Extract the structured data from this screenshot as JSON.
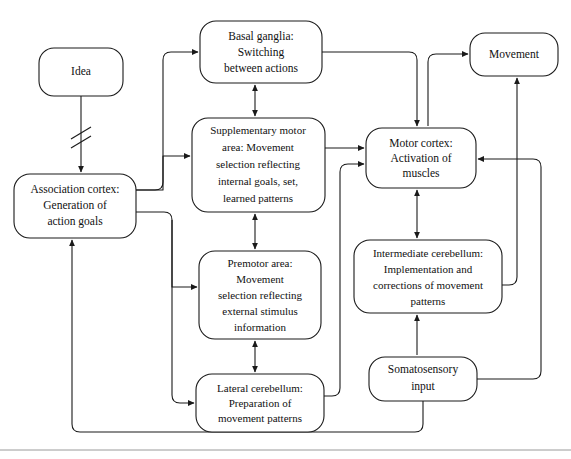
{
  "diagram": {
    "background_color": "#ffffff",
    "line_color": "#1a1a1a",
    "nodes": [
      {
        "id": "idea",
        "name": "idea",
        "lines": [
          "Idea"
        ],
        "x": 39,
        "y": 48,
        "w": 84,
        "h": 48
      },
      {
        "id": "association-cortex",
        "name": "association-cortex",
        "lines": [
          "Association cortex:",
          "Generation of",
          "action goals"
        ],
        "x": 14,
        "y": 174,
        "w": 122,
        "h": 64
      },
      {
        "id": "basal-ganglia",
        "name": "basal-ganglia",
        "lines": [
          "Basal ganglia:",
          "Switching",
          "between actions"
        ],
        "x": 200,
        "y": 21,
        "w": 122,
        "h": 62
      },
      {
        "id": "supplementary-motor-area",
        "name": "supplementary-motor-area",
        "lines": [
          "Supplementary motor",
          "area:  Movement",
          "selection reflecting",
          "internal goals, set,",
          "learned patterns"
        ],
        "x": 192,
        "y": 118,
        "w": 133,
        "h": 94
      },
      {
        "id": "premotor-area",
        "name": "premotor-area",
        "lines": [
          "Premotor area:",
          "Movement",
          "selection reflecting",
          "external stimulus",
          "information"
        ],
        "x": 199,
        "y": 251,
        "w": 122,
        "h": 88
      },
      {
        "id": "lateral-cerebellum",
        "name": "lateral-cerebellum",
        "lines": [
          "Lateral cerebellum:",
          "Preparation of",
          "movement patterns"
        ],
        "x": 196,
        "y": 374,
        "w": 128,
        "h": 58
      },
      {
        "id": "motor-cortex",
        "name": "motor-cortex",
        "lines": [
          "Motor cortex:",
          "Activation of",
          "muscles"
        ],
        "x": 366,
        "y": 128,
        "w": 110,
        "h": 60
      },
      {
        "id": "intermediate-cerebellum",
        "name": "intermediate-cerebellum",
        "lines": [
          "Intermediate cerebellum:",
          "Implementation and",
          "corrections of movement",
          "patterns"
        ],
        "x": 354,
        "y": 240,
        "w": 148,
        "h": 73
      },
      {
        "id": "somatosensory-input",
        "name": "somatosensory-input",
        "lines": [
          "Somatosensory",
          "input"
        ],
        "x": 369,
        "y": 357,
        "w": 108,
        "h": 44
      },
      {
        "id": "movement",
        "name": "movement",
        "lines": [
          "Movement"
        ],
        "x": 470,
        "y": 33,
        "w": 88,
        "h": 43
      }
    ],
    "edges": [
      {
        "id": "idea-to-association",
        "name": "edge-idea-to-association-cortex",
        "from": "idea",
        "to": "association-cortex",
        "style": "interrupted"
      },
      {
        "id": "association-to-basal",
        "name": "edge-association-cortex-to-basal-ganglia",
        "from": "association-cortex",
        "to": "basal-ganglia",
        "style": "plain"
      },
      {
        "id": "association-to-sma",
        "name": "edge-association-cortex-to-supplementary-motor-area",
        "from": "association-cortex",
        "to": "supplementary-motor-area",
        "style": "plain"
      },
      {
        "id": "association-to-premotor",
        "name": "edge-association-cortex-to-premotor-area",
        "from": "association-cortex",
        "to": "premotor-area",
        "style": "plain"
      },
      {
        "id": "association-to-lateral",
        "name": "edge-association-cortex-to-lateral-cerebellum",
        "from": "association-cortex",
        "to": "lateral-cerebellum",
        "style": "plain"
      },
      {
        "id": "basal-sma",
        "name": "edge-basal-ganglia-supplementary-motor-area",
        "from": "basal-ganglia",
        "to": "supplementary-motor-area",
        "style": "bidirectional"
      },
      {
        "id": "sma-premotor",
        "name": "edge-supplementary-motor-area-premotor-area",
        "from": "supplementary-motor-area",
        "to": "premotor-area",
        "style": "bidirectional"
      },
      {
        "id": "premotor-lateral",
        "name": "edge-premotor-area-lateral-cerebellum",
        "from": "premotor-area",
        "to": "lateral-cerebellum",
        "style": "bidirectional"
      },
      {
        "id": "basal-to-motor",
        "name": "edge-basal-ganglia-to-motor-cortex",
        "from": "basal-ganglia",
        "to": "motor-cortex",
        "style": "plain"
      },
      {
        "id": "sma-to-motor",
        "name": "edge-supplementary-motor-area-to-motor-cortex",
        "from": "supplementary-motor-area",
        "to": "motor-cortex",
        "style": "plain"
      },
      {
        "id": "lateral-to-motor",
        "name": "edge-lateral-cerebellum-to-motor-cortex",
        "from": "lateral-cerebellum",
        "to": "motor-cortex",
        "style": "plain"
      },
      {
        "id": "motor-intermediate",
        "name": "edge-motor-cortex-intermediate-cerebellum",
        "from": "motor-cortex",
        "to": "intermediate-cerebellum",
        "style": "bidirectional"
      },
      {
        "id": "motor-to-movement",
        "name": "edge-motor-cortex-to-movement",
        "from": "motor-cortex",
        "to": "movement",
        "style": "plain"
      },
      {
        "id": "intermediate-to-movement",
        "name": "edge-intermediate-cerebellum-to-movement",
        "from": "intermediate-cerebellum",
        "to": "movement",
        "style": "plain"
      },
      {
        "id": "somato-to-intermediate",
        "name": "edge-somatosensory-input-to-intermediate-cerebellum",
        "from": "somatosensory-input",
        "to": "intermediate-cerebellum",
        "style": "plain"
      },
      {
        "id": "somato-to-motor",
        "name": "edge-somatosensory-input-to-motor-cortex",
        "from": "somatosensory-input",
        "to": "motor-cortex",
        "style": "plain"
      },
      {
        "id": "somato-to-association",
        "name": "edge-somatosensory-input-to-association-cortex",
        "from": "somatosensory-input",
        "to": "association-cortex",
        "style": "plain"
      }
    ]
  }
}
